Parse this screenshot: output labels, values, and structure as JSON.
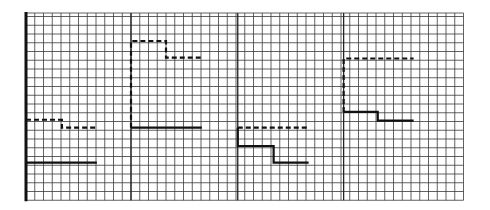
{
  "chart_data": {
    "type": "line",
    "title": "",
    "xlabel": "",
    "ylabel": "",
    "grid": true,
    "legend": null,
    "grid_spec": {
      "columns": 50,
      "rows": 21.4,
      "x_range": [
        0,
        50
      ],
      "y_range": [
        0,
        21.4
      ],
      "panel_dividers_x": [
        12,
        24.2,
        36.3
      ]
    },
    "series": [
      {
        "name": "dashed",
        "style": "dashed",
        "segments": [
          {
            "panel": 1,
            "points": [
              [
                0,
                9.2
              ],
              [
                4.1,
                9.2
              ],
              [
                4.1,
                8.3
              ],
              [
                8.1,
                8.3
              ]
            ]
          },
          {
            "panel": 2,
            "points": [
              [
                12,
                8.3
              ],
              [
                12,
                18.2
              ],
              [
                16,
                18.2
              ],
              [
                16,
                16.3
              ],
              [
                20.1,
                16.3
              ]
            ]
          },
          {
            "panel": 3,
            "points": [
              [
                24.2,
                8.3
              ],
              [
                32.3,
                8.3
              ]
            ]
          },
          {
            "panel": 4,
            "points": [
              [
                36.3,
                10.1
              ],
              [
                36.3,
                16.2
              ],
              [
                44.3,
                16.2
              ]
            ]
          }
        ]
      },
      {
        "name": "solid",
        "style": "solid",
        "segments": [
          {
            "panel": 1,
            "points": [
              [
                0,
                4.3
              ],
              [
                8.1,
                4.3
              ]
            ]
          },
          {
            "panel": 2,
            "points": [
              [
                12,
                8.3
              ],
              [
                20.1,
                8.3
              ]
            ]
          },
          {
            "panel": 3,
            "points": [
              [
                24.2,
                8.3
              ],
              [
                24.2,
                6.2
              ],
              [
                28.3,
                6.2
              ],
              [
                28.3,
                4.3
              ],
              [
                32.3,
                4.3
              ]
            ]
          },
          {
            "panel": 4,
            "points": [
              [
                36.3,
                10.1
              ],
              [
                40.2,
                10.1
              ],
              [
                40.2,
                9.1
              ],
              [
                44.3,
                9.1
              ]
            ]
          }
        ]
      }
    ]
  },
  "colors": {
    "background": "#ffffff",
    "grid": "#3a3a3a",
    "lines": "#111111"
  }
}
